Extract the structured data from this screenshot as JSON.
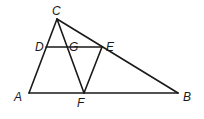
{
  "diagram": {
    "type": "geometry-triangle",
    "points": {
      "A": {
        "label": "A",
        "x": 29,
        "y": 93
      },
      "B": {
        "label": "B",
        "x": 178,
        "y": 93
      },
      "C": {
        "label": "C",
        "x": 57,
        "y": 19
      },
      "D": {
        "label": "D",
        "x": 46,
        "y": 47
      },
      "E": {
        "label": "E",
        "x": 102,
        "y": 47
      },
      "F": {
        "label": "F",
        "x": 84,
        "y": 93
      },
      "G": {
        "label": "G",
        "x": 67,
        "y": 47
      }
    },
    "segments": [
      "AB",
      "BC",
      "CA",
      "DE",
      "CF",
      "EF"
    ],
    "labels": {
      "A": "A",
      "B": "B",
      "C": "C",
      "D": "D",
      "E": "E",
      "F": "F",
      "G": "G"
    }
  }
}
